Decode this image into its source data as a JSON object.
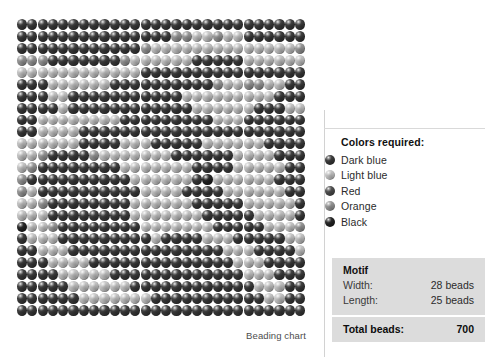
{
  "chart": {
    "caption": "Beading chart",
    "palette": {
      "dark_blue": "#3a3a3a",
      "light_blue": "#c9c9c9",
      "red": "#4e4e4e",
      "orange": "#9a9a9a",
      "black": "#232323"
    },
    "grid": {
      "columns": 28,
      "rows": 25,
      "cells": [
        [
          0,
          0,
          0,
          0,
          0,
          0,
          0,
          0,
          0,
          0,
          0,
          0,
          0,
          0,
          0,
          0,
          0,
          0,
          0,
          0,
          0,
          0,
          0,
          0,
          0,
          0,
          0,
          0
        ],
        [
          0,
          0,
          0,
          0,
          0,
          0,
          0,
          0,
          0,
          0,
          0,
          0,
          0,
          0,
          0,
          3,
          3,
          1,
          1,
          3,
          1,
          1,
          0,
          0,
          0,
          0,
          0,
          0
        ],
        [
          0,
          0,
          0,
          0,
          0,
          0,
          0,
          0,
          0,
          0,
          0,
          0,
          3,
          1,
          1,
          1,
          1,
          1,
          1,
          1,
          1,
          1,
          1,
          1,
          1,
          1,
          1,
          3
        ],
        [
          3,
          3,
          3,
          0,
          0,
          0,
          0,
          0,
          0,
          0,
          3,
          1,
          1,
          1,
          1,
          1,
          1,
          0,
          0,
          0,
          0,
          0,
          1,
          1,
          1,
          1,
          1,
          1
        ],
        [
          1,
          1,
          1,
          1,
          1,
          1,
          1,
          1,
          1,
          1,
          1,
          1,
          0,
          0,
          0,
          0,
          0,
          0,
          0,
          0,
          0,
          0,
          0,
          0,
          0,
          0,
          0,
          0
        ],
        [
          0,
          0,
          0,
          1,
          1,
          1,
          1,
          1,
          1,
          0,
          0,
          0,
          0,
          0,
          0,
          0,
          0,
          0,
          0,
          3,
          1,
          1,
          3,
          3,
          1,
          1,
          0,
          0
        ],
        [
          0,
          0,
          0,
          1,
          1,
          0,
          0,
          0,
          0,
          0,
          0,
          0,
          0,
          0,
          0,
          0,
          1,
          1,
          1,
          1,
          1,
          1,
          1,
          1,
          1,
          0,
          0,
          0
        ],
        [
          0,
          0,
          0,
          0,
          1,
          0,
          0,
          0,
          0,
          0,
          0,
          0,
          0,
          0,
          0,
          0,
          0,
          1,
          1,
          1,
          1,
          1,
          1,
          0,
          0,
          0,
          1,
          1
        ],
        [
          0,
          0,
          1,
          1,
          1,
          1,
          1,
          1,
          1,
          1,
          0,
          0,
          0,
          0,
          0,
          0,
          0,
          0,
          0,
          1,
          1,
          1,
          0,
          0,
          0,
          0,
          0,
          0
        ],
        [
          0,
          0,
          1,
          1,
          1,
          1,
          0,
          0,
          0,
          0,
          0,
          0,
          0,
          0,
          0,
          0,
          0,
          0,
          0,
          0,
          0,
          0,
          0,
          0,
          0,
          0,
          0,
          0
        ],
        [
          1,
          1,
          1,
          1,
          1,
          1,
          0,
          0,
          0,
          0,
          1,
          1,
          1,
          0,
          0,
          0,
          0,
          0,
          1,
          1,
          1,
          1,
          1,
          1,
          0,
          0,
          0,
          0
        ],
        [
          1,
          1,
          3,
          0,
          0,
          0,
          0,
          3,
          1,
          1,
          1,
          1,
          1,
          1,
          1,
          0,
          0,
          0,
          0,
          0,
          0,
          1,
          1,
          1,
          1,
          0,
          0,
          0
        ],
        [
          1,
          3,
          0,
          0,
          0,
          0,
          0,
          0,
          0,
          0,
          1,
          1,
          1,
          1,
          1,
          1,
          1,
          0,
          0,
          0,
          0,
          1,
          1,
          1,
          1,
          1,
          0,
          0
        ],
        [
          3,
          0,
          0,
          0,
          0,
          0,
          0,
          0,
          0,
          0,
          0,
          1,
          1,
          1,
          1,
          1,
          1,
          0,
          4,
          1,
          1,
          1,
          1,
          1,
          1,
          0,
          0,
          0
        ],
        [
          3,
          1,
          0,
          0,
          0,
          0,
          0,
          0,
          0,
          0,
          0,
          0,
          1,
          1,
          1,
          1,
          0,
          0,
          0,
          0,
          1,
          1,
          1,
          1,
          1,
          1,
          0,
          0
        ],
        [
          1,
          1,
          3,
          0,
          0,
          0,
          0,
          0,
          0,
          0,
          0,
          1,
          1,
          1,
          1,
          1,
          1,
          0,
          0,
          0,
          0,
          0,
          1,
          1,
          1,
          1,
          1,
          0
        ],
        [
          1,
          1,
          1,
          0,
          0,
          0,
          0,
          0,
          0,
          0,
          0,
          1,
          1,
          1,
          1,
          1,
          1,
          1,
          0,
          0,
          0,
          0,
          0,
          1,
          1,
          1,
          1,
          0
        ],
        [
          4,
          1,
          1,
          3,
          0,
          0,
          0,
          0,
          0,
          0,
          0,
          0,
          1,
          1,
          1,
          1,
          1,
          1,
          1,
          0,
          0,
          0,
          0,
          0,
          1,
          1,
          1,
          3
        ],
        [
          0,
          1,
          1,
          1,
          0,
          0,
          0,
          0,
          0,
          0,
          0,
          0,
          0,
          1,
          0,
          0,
          0,
          0,
          1,
          1,
          1,
          0,
          0,
          0,
          0,
          0,
          1,
          1
        ],
        [
          0,
          0,
          1,
          1,
          1,
          0,
          0,
          0,
          0,
          0,
          0,
          0,
          0,
          0,
          0,
          0,
          0,
          0,
          0,
          0,
          1,
          1,
          1,
          0,
          0,
          0,
          0,
          1
        ],
        [
          0,
          0,
          0,
          1,
          1,
          1,
          1,
          0,
          0,
          0,
          0,
          0,
          0,
          0,
          0,
          0,
          0,
          0,
          0,
          0,
          0,
          1,
          1,
          1,
          0,
          0,
          0,
          0
        ],
        [
          0,
          0,
          0,
          0,
          1,
          1,
          1,
          1,
          1,
          0,
          0,
          0,
          0,
          0,
          0,
          0,
          0,
          0,
          0,
          0,
          0,
          0,
          1,
          1,
          1,
          0,
          0,
          0
        ],
        [
          0,
          0,
          0,
          0,
          0,
          1,
          1,
          1,
          1,
          1,
          1,
          0,
          0,
          0,
          0,
          0,
          0,
          0,
          0,
          0,
          0,
          0,
          0,
          1,
          1,
          1,
          0,
          0
        ],
        [
          0,
          0,
          0,
          0,
          0,
          0,
          1,
          1,
          1,
          1,
          1,
          1,
          1,
          0,
          0,
          0,
          0,
          0,
          0,
          0,
          0,
          0,
          0,
          0,
          1,
          1,
          0,
          0
        ],
        [
          0,
          0,
          0,
          0,
          0,
          0,
          0,
          0,
          0,
          0,
          0,
          0,
          0,
          0,
          0,
          0,
          0,
          0,
          0,
          0,
          0,
          0,
          0,
          0,
          0,
          0,
          0,
          0
        ]
      ]
    }
  },
  "legend": {
    "title": "Colors required:",
    "items": [
      {
        "label": "Dark blue",
        "color": "#3a3a3a"
      },
      {
        "label": "Light blue",
        "color": "#c9c9c9"
      },
      {
        "label": "Red",
        "color": "#4e4e4e"
      },
      {
        "label": "Orange",
        "color": "#9a9a9a"
      },
      {
        "label": "Black",
        "color": "#232323"
      }
    ]
  },
  "motif": {
    "title": "Motif",
    "width_label": "Width:",
    "width_value": "28 beads",
    "length_label": "Length:",
    "length_value": "25 beads",
    "total_label": "Total beads:",
    "total_value": "700"
  }
}
